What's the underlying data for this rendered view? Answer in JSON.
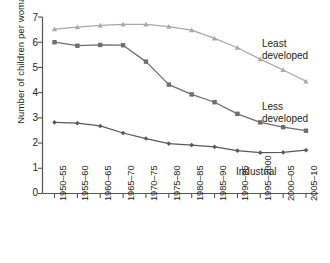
{
  "chart_data": {
    "type": "line",
    "title": "",
    "xlabel": "",
    "ylabel": "Number of children per woman",
    "ylim": [
      0,
      7
    ],
    "yticks": [
      "0",
      "1",
      "2",
      "3",
      "4",
      "5",
      "6",
      "7"
    ],
    "grid": false,
    "legend_position": "inline-right",
    "categories": [
      "1950–55",
      "1955–60",
      "1960–65",
      "1965–70",
      "1970–75",
      "1975–80",
      "1980–85",
      "1985–90",
      "1990–95",
      "1995–2000",
      "2000–05",
      "2005–10"
    ],
    "series": [
      {
        "name": "Least developed",
        "color": "#a8a8a8",
        "marker": "triangle",
        "values": [
          6.52,
          6.6,
          6.67,
          6.71,
          6.71,
          6.62,
          6.48,
          6.15,
          5.78,
          5.33,
          4.9,
          4.45
        ]
      },
      {
        "name": "Less developed",
        "color": "#6e6e6e",
        "marker": "square",
        "values": [
          6.0,
          5.86,
          5.89,
          5.88,
          5.23,
          4.32,
          3.93,
          3.62,
          3.16,
          2.82,
          2.63,
          2.49
        ]
      },
      {
        "name": "Industrial",
        "color": "#595959",
        "marker": "diamond",
        "values": [
          2.82,
          2.79,
          2.68,
          2.4,
          2.18,
          1.98,
          1.92,
          1.85,
          1.7,
          1.62,
          1.63,
          1.72
        ]
      }
    ]
  },
  "labels": {
    "least_developed_line1": "Least",
    "least_developed_line2": "developed",
    "less_developed_line1": "Less",
    "less_developed_line2": "developed",
    "industrial": "Industrial"
  },
  "axis": {
    "y_title": "Number of children per woman",
    "y_0": "0",
    "y_1": "1",
    "y_2": "2",
    "y_3": "3",
    "y_4": "4",
    "y_5": "5",
    "y_6": "6",
    "y_7": "7"
  },
  "colors": {
    "axis": "#555555",
    "least_developed": "#a8a8a8",
    "less_developed": "#6e6e6e",
    "industrial": "#595959",
    "text": "#231f20"
  }
}
